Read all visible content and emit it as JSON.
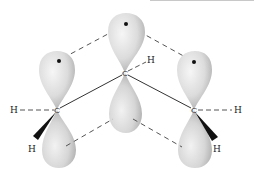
{
  "diagram": {
    "title": "",
    "atoms": {
      "left_carbon": {
        "label": "C",
        "x": 57,
        "y": 110
      },
      "center_carbon": {
        "label": "C",
        "x": 125,
        "y": 73
      },
      "right_carbon": {
        "label": "C",
        "x": 194,
        "y": 110
      }
    },
    "hydrogens": {
      "left_h_plain": {
        "label": "H"
      },
      "left_h_wedge": {
        "label": "H"
      },
      "center_h": {
        "label": "H"
      },
      "right_h_plain": {
        "label": "H"
      },
      "right_h_wedge": {
        "label": "H"
      }
    },
    "orbitals": [
      {
        "name": "left-p-orbital",
        "has_electron_dot": true
      },
      {
        "name": "center-p-orbital",
        "has_electron_dot": true
      },
      {
        "name": "right-p-orbital",
        "has_electron_dot": true
      }
    ],
    "colors": {
      "lobe_fill": "#d9d9d9",
      "lobe_highlight": "#f4f4f4",
      "lobe_shadow": "#a8a8a8",
      "line": "#333333",
      "dash": "#555555"
    }
  }
}
